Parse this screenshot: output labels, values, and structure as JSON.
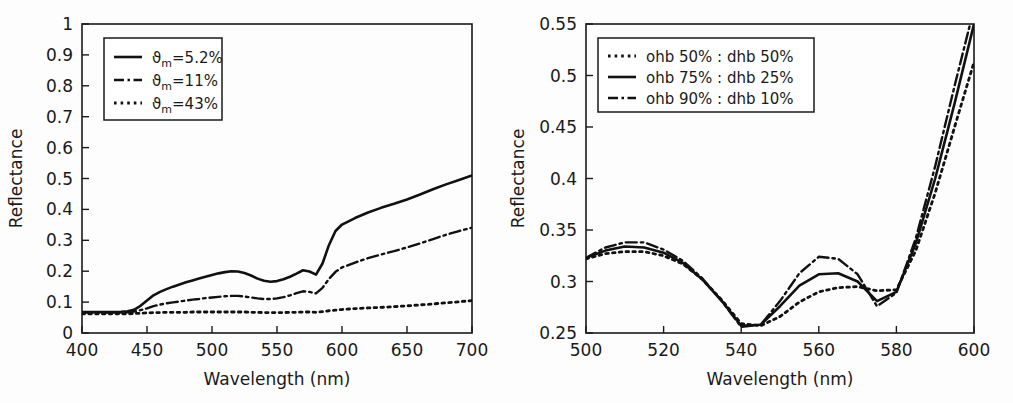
{
  "figure": {
    "background": "#fdfdfd",
    "ink_color": "#111111",
    "panels": [
      "left",
      "right"
    ]
  },
  "chart_data": [
    {
      "id": "left-panel",
      "type": "line",
      "title": "",
      "xlabel": "Wavelength (nm)",
      "ylabel": "Reflectance",
      "xlim": [
        400,
        700
      ],
      "ylim": [
        0,
        1
      ],
      "xticks": [
        400,
        450,
        500,
        550,
        600,
        650,
        700
      ],
      "xticklabels": [
        "400",
        "450",
        "500",
        "550",
        "600",
        "650",
        "700"
      ],
      "yticks": [
        0,
        0.1,
        0.2,
        0.3,
        0.4,
        0.5,
        0.6,
        0.7,
        0.8,
        0.9,
        1
      ],
      "yticklabels": [
        "0",
        "0.1",
        "0.2",
        "0.3",
        "0.4",
        "0.5",
        "0.6",
        "0.7",
        "0.8",
        "0.9",
        "1"
      ],
      "grid": false,
      "legend_position": "upper-left",
      "x": [
        400,
        410,
        420,
        430,
        435,
        440,
        445,
        450,
        455,
        460,
        465,
        470,
        475,
        480,
        485,
        490,
        495,
        500,
        505,
        510,
        515,
        520,
        525,
        530,
        535,
        540,
        545,
        550,
        555,
        560,
        565,
        570,
        575,
        580,
        585,
        590,
        595,
        600,
        610,
        620,
        630,
        640,
        650,
        660,
        670,
        680,
        690,
        700
      ],
      "series": [
        {
          "name": "ϑm=5.2%",
          "label_base": "ϑ",
          "label_sub": "m",
          "label_rest": "=5.2%",
          "style": "solid",
          "values": [
            0.068,
            0.068,
            0.068,
            0.069,
            0.07,
            0.075,
            0.088,
            0.105,
            0.122,
            0.133,
            0.142,
            0.15,
            0.157,
            0.164,
            0.17,
            0.176,
            0.182,
            0.188,
            0.193,
            0.197,
            0.2,
            0.199,
            0.194,
            0.186,
            0.176,
            0.169,
            0.166,
            0.168,
            0.174,
            0.182,
            0.192,
            0.203,
            0.199,
            0.189,
            0.225,
            0.285,
            0.33,
            0.351,
            0.372,
            0.39,
            0.405,
            0.418,
            0.432,
            0.448,
            0.465,
            0.481,
            0.495,
            0.51
          ]
        },
        {
          "name": "ϑm=11%",
          "label_base": "ϑ",
          "label_sub": "m",
          "label_rest": "=11%",
          "style": "dashdot",
          "values": [
            0.066,
            0.066,
            0.066,
            0.066,
            0.067,
            0.069,
            0.074,
            0.08,
            0.087,
            0.092,
            0.096,
            0.099,
            0.102,
            0.105,
            0.108,
            0.11,
            0.113,
            0.115,
            0.117,
            0.119,
            0.12,
            0.12,
            0.118,
            0.115,
            0.112,
            0.11,
            0.11,
            0.112,
            0.116,
            0.122,
            0.129,
            0.135,
            0.133,
            0.128,
            0.146,
            0.175,
            0.198,
            0.212,
            0.228,
            0.242,
            0.254,
            0.265,
            0.277,
            0.29,
            0.304,
            0.318,
            0.33,
            0.341
          ]
        },
        {
          "name": "ϑm=43%",
          "label_base": "ϑ",
          "label_sub": "m",
          "label_rest": "=43%",
          "style": "dotted",
          "values": [
            0.062,
            0.062,
            0.062,
            0.062,
            0.062,
            0.063,
            0.064,
            0.065,
            0.066,
            0.066,
            0.067,
            0.067,
            0.067,
            0.067,
            0.068,
            0.068,
            0.068,
            0.068,
            0.068,
            0.068,
            0.068,
            0.068,
            0.068,
            0.067,
            0.067,
            0.066,
            0.066,
            0.066,
            0.066,
            0.067,
            0.067,
            0.068,
            0.068,
            0.067,
            0.069,
            0.072,
            0.074,
            0.076,
            0.079,
            0.081,
            0.083,
            0.085,
            0.088,
            0.091,
            0.094,
            0.098,
            0.101,
            0.105
          ]
        }
      ]
    },
    {
      "id": "right-panel",
      "type": "line",
      "title": "",
      "xlabel": "Wavelength (nm)",
      "ylabel": "Reflectance",
      "xlim": [
        500,
        600
      ],
      "ylim": [
        0.25,
        0.55
      ],
      "xticks": [
        500,
        520,
        540,
        560,
        580,
        600
      ],
      "xticklabels": [
        "500",
        "520",
        "540",
        "560",
        "580",
        "600"
      ],
      "yticks": [
        0.25,
        0.3,
        0.35,
        0.4,
        0.45,
        0.5,
        0.55
      ],
      "yticklabels": [
        "0.25",
        "0.3",
        "0.35",
        "0.4",
        "0.45",
        "0.5",
        "0.55"
      ],
      "grid": false,
      "legend_position": "upper-left",
      "x": [
        500,
        505,
        510,
        515,
        520,
        525,
        530,
        535,
        540,
        545,
        550,
        555,
        560,
        565,
        570,
        575,
        580,
        585,
        590,
        595,
        600
      ],
      "series": [
        {
          "name": "ohb 50% : dhb 50%",
          "style": "dotted",
          "values": [
            0.322,
            0.327,
            0.329,
            0.329,
            0.325,
            0.317,
            0.302,
            0.282,
            0.259,
            0.257,
            0.266,
            0.28,
            0.29,
            0.294,
            0.295,
            0.291,
            0.292,
            0.33,
            0.386,
            0.45,
            0.513
          ]
        },
        {
          "name": "ohb 75% : dhb 25%",
          "style": "solid",
          "values": [
            0.323,
            0.33,
            0.334,
            0.333,
            0.328,
            0.318,
            0.302,
            0.281,
            0.257,
            0.258,
            0.276,
            0.296,
            0.307,
            0.308,
            0.3,
            0.281,
            0.29,
            0.337,
            0.4,
            0.473,
            0.55
          ]
        },
        {
          "name": "ohb 90% : dhb 10%",
          "style": "dashdot",
          "values": [
            0.323,
            0.333,
            0.338,
            0.338,
            0.331,
            0.32,
            0.303,
            0.281,
            0.256,
            0.258,
            0.281,
            0.308,
            0.324,
            0.322,
            0.307,
            0.276,
            0.289,
            0.342,
            0.412,
            0.49,
            0.565
          ]
        }
      ]
    }
  ]
}
